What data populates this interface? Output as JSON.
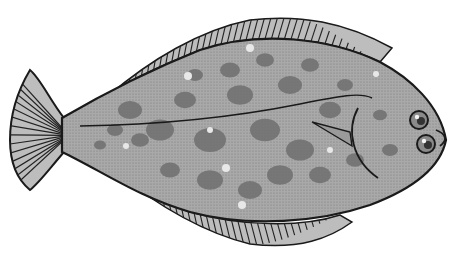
{
  "image": {
    "subject": "Flounder (flatfish) illustration",
    "style": "grayscale stippled line drawing",
    "background": "#ffffff"
  },
  "colors": {
    "outline": "#1a1a1a",
    "body_base": "#a9a9a9",
    "spot_dark": "#6e6e6e",
    "spot_light": "#e8e8e8",
    "fin_fill": "#bdbdbd",
    "fin_ray": "#222222"
  },
  "fish": {
    "body_path": "M62,118 C110,90 150,70 200,50 C260,30 330,38 380,62 C410,78 440,105 446,140 C440,170 410,190 370,205 C320,222 250,228 190,212 C140,198 100,170 62,152 Z",
    "dorsal_fin_path": "M108,96 C150,60 200,30 250,20 C300,14 345,22 392,48 L380,62 C330,38 260,30 200,50 C150,70 120,85 108,96 Z",
    "anal_fin_path": "M110,168 C150,200 200,232 250,244 C300,250 330,238 352,222 L340,215 C300,228 240,226 190,212 C150,198 125,180 110,168 Z",
    "tail_path": "M64,118 C50,100 40,78 30,70 C18,90 10,115 10,140 C10,165 18,180 30,190 C40,182 50,168 64,152 Z",
    "lateral_line_path": "M80,126 C150,125 230,118 300,104 C340,96 360,92 372,98",
    "gill_path": "M358,108 C346,130 352,160 378,178",
    "pectoral_fin_path": "M312,122 L350,132 L352,146 Z",
    "eyes": [
      {
        "cx": 419,
        "cy": 120,
        "r": 9
      },
      {
        "cx": 426,
        "cy": 144,
        "r": 9
      }
    ],
    "mouth_path": "M436,130 C446,134 448,140 440,146",
    "spots_dark": [
      [
        130,
        110,
        12
      ],
      [
        160,
        130,
        14
      ],
      [
        185,
        100,
        11
      ],
      [
        210,
        140,
        16
      ],
      [
        240,
        95,
        13
      ],
      [
        265,
        130,
        15
      ],
      [
        290,
        85,
        12
      ],
      [
        300,
        150,
        14
      ],
      [
        330,
        110,
        11
      ],
      [
        210,
        180,
        13
      ],
      [
        250,
        190,
        12
      ],
      [
        170,
        170,
        10
      ],
      [
        140,
        140,
        9
      ],
      [
        280,
        175,
        13
      ],
      [
        320,
        175,
        11
      ],
      [
        355,
        160,
        9
      ],
      [
        230,
        70,
        10
      ],
      [
        195,
        75,
        8
      ],
      [
        265,
        60,
        9
      ],
      [
        310,
        65,
        9
      ],
      [
        345,
        85,
        8
      ],
      [
        115,
        130,
        8
      ],
      [
        100,
        145,
        6
      ],
      [
        390,
        150,
        8
      ],
      [
        380,
        115,
        7
      ]
    ],
    "spots_light": [
      [
        250,
        48,
        4
      ],
      [
        188,
        76,
        4
      ],
      [
        226,
        168,
        4
      ],
      [
        210,
        130,
        3
      ],
      [
        242,
        205,
        4
      ],
      [
        126,
        146,
        3
      ],
      [
        376,
        74,
        3
      ],
      [
        330,
        150,
        3
      ]
    ],
    "dorsal_rays": 46,
    "anal_rays": 40,
    "tail_rays": 14
  }
}
